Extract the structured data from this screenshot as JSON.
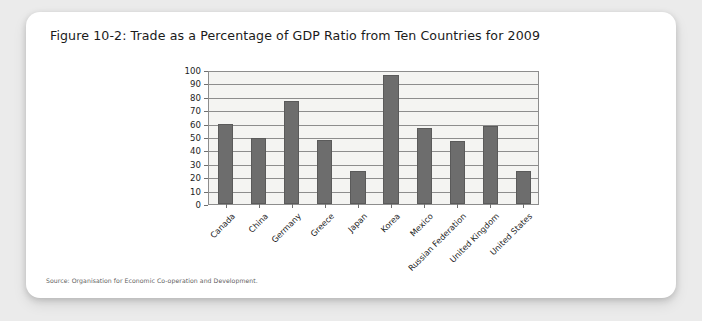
{
  "figure": {
    "title": "Figure 10-2: Trade as a Percentage of GDP Ratio from Ten Countries for 2009",
    "source": "Source: Organisation for Economic Co-operation and Development.",
    "card_background": "#ffffff",
    "page_background": "#ebebeb"
  },
  "chart_data": {
    "type": "bar",
    "title": "Figure 10-2: Trade as a Percentage of GDP Ratio from Ten Countries for 2009",
    "categories": [
      "Canada",
      "China",
      "Germany",
      "Greece",
      "Japan",
      "Korea",
      "Mexico",
      "Russian Federation",
      "United Kingdom",
      "United States"
    ],
    "values": [
      60,
      49,
      77,
      48,
      25,
      96,
      57,
      47,
      58,
      25
    ],
    "xlabel": "",
    "ylabel": "",
    "ylim": [
      0,
      100
    ],
    "ytick_values": [
      0,
      10,
      20,
      30,
      40,
      50,
      60,
      70,
      80,
      90,
      100
    ],
    "ytick_labels": [
      "0",
      "10",
      "20",
      "30",
      "40",
      "50",
      "60",
      "70",
      "80",
      "90",
      "100"
    ],
    "grid": true,
    "legend": false,
    "legend_position": "none",
    "bar_color": "#6d6d6d",
    "plot_background": "#f4f4f2",
    "gridline_color": "#8d8d8d"
  }
}
